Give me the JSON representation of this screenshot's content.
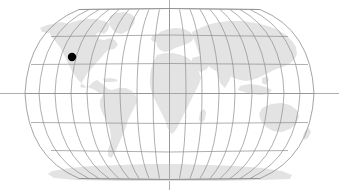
{
  "map": {
    "title": "World Map",
    "projection": "robinson",
    "background_color": "#ffffff",
    "land_color": "#e3e3e3",
    "graticule_color": "#8d8d8d",
    "outline_color": "#8d8d8d",
    "marker_color": "#000000",
    "canvas": {
      "width": 339,
      "height": 190
    },
    "ellipse": {
      "center_x": 169.5,
      "center_y": 94,
      "half_width": 144,
      "half_height": 85
    },
    "graticule": {
      "meridian_interval_deg": 20,
      "parallel_interval_deg": 30,
      "meridian_longitudes": [
        -180,
        -160,
        -140,
        -120,
        -100,
        -80,
        -60,
        -40,
        -20,
        0,
        20,
        40,
        60,
        80,
        100,
        120,
        140,
        160,
        180
      ],
      "parallel_latitudes": [
        90,
        60,
        30,
        0,
        -30,
        -60,
        -90
      ],
      "axis_lines": {
        "prime_meridian_full_height": true,
        "equator_full_width": true
      }
    },
    "marker": {
      "name": "location-marker",
      "x": 72,
      "y": 57,
      "radius": 4.2,
      "region": "North America West Coast"
    },
    "landmasses": [
      {
        "name": "north-america"
      },
      {
        "name": "greenland"
      },
      {
        "name": "south-america"
      },
      {
        "name": "europe"
      },
      {
        "name": "africa"
      },
      {
        "name": "asia"
      },
      {
        "name": "australia"
      },
      {
        "name": "antarctica"
      },
      {
        "name": "japan"
      },
      {
        "name": "madagascar"
      },
      {
        "name": "new-zealand"
      },
      {
        "name": "indonesia"
      },
      {
        "name": "british-isles"
      },
      {
        "name": "caribbean"
      }
    ]
  }
}
